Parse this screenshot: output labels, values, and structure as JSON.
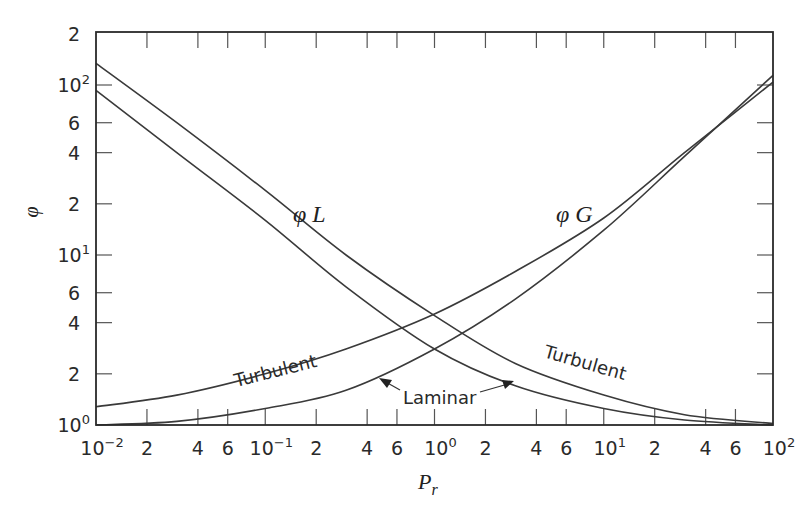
{
  "chart_data": {
    "type": "line",
    "title": "",
    "xlabel": "P_r",
    "ylabel": "φ",
    "xscale": "log",
    "yscale": "log",
    "xlim": [
      0.01,
      100
    ],
    "ylim": [
      1,
      200
    ],
    "grid": false,
    "x_ticks": [
      {
        "v": 0.01,
        "base": "10",
        "exp": "−2"
      },
      {
        "v": 0.02,
        "base": "2"
      },
      {
        "v": 0.04,
        "base": "4"
      },
      {
        "v": 0.06,
        "base": "6"
      },
      {
        "v": 0.1,
        "base": "10",
        "exp": "−1"
      },
      {
        "v": 0.2,
        "base": "2"
      },
      {
        "v": 0.4,
        "base": "4"
      },
      {
        "v": 0.6,
        "base": "6"
      },
      {
        "v": 1,
        "base": "10",
        "exp": "0"
      },
      {
        "v": 2,
        "base": "2"
      },
      {
        "v": 4,
        "base": "4"
      },
      {
        "v": 6,
        "base": "6"
      },
      {
        "v": 10,
        "base": "10",
        "exp": "1"
      },
      {
        "v": 20,
        "base": "2"
      },
      {
        "v": 40,
        "base": "4"
      },
      {
        "v": 60,
        "base": "6"
      },
      {
        "v": 100,
        "base": "10",
        "exp": "2"
      }
    ],
    "y_ticks": [
      {
        "v": 1,
        "base": "10",
        "exp": "0"
      },
      {
        "v": 2,
        "base": "2"
      },
      {
        "v": 4,
        "base": "4"
      },
      {
        "v": 6,
        "base": "6"
      },
      {
        "v": 10,
        "base": "10",
        "exp": "1"
      },
      {
        "v": 20,
        "base": "2"
      },
      {
        "v": 40,
        "base": "4"
      },
      {
        "v": 60,
        "base": "6"
      },
      {
        "v": 100,
        "base": "10",
        "exp": "2"
      },
      {
        "v": 200,
        "base": "2"
      }
    ],
    "x": [
      0.01,
      0.03,
      0.1,
      0.3,
      1,
      3,
      10,
      30,
      100
    ],
    "series": [
      {
        "name": "φL Turbulent",
        "values": [
          134,
          60,
          24,
          10,
          4.4,
          2.3,
          1.5,
          1.15,
          1.02
        ]
      },
      {
        "name": "φL Laminar",
        "values": [
          93,
          40,
          16,
          6.5,
          2.8,
          1.7,
          1.25,
          1.07,
          1.0
        ]
      },
      {
        "name": "φG Turbulent",
        "values": [
          1.28,
          1.5,
          2.0,
          2.8,
          4.5,
          8,
          16.5,
          40,
          104
        ]
      },
      {
        "name": "φG Laminar",
        "values": [
          1.0,
          1.05,
          1.25,
          1.6,
          2.8,
          5.5,
          14,
          38,
          114
        ]
      }
    ],
    "annotations": [
      {
        "text": "φ L",
        "near": "φL Turbulent",
        "x": 0.25,
        "y": 19
      },
      {
        "text": "φ G",
        "near": "φG Turbulent",
        "x": 7,
        "y": 19
      },
      {
        "text": "Turbulent",
        "near": "φG Turbulent",
        "x": 0.04,
        "y": 2.2
      },
      {
        "text": "Turbulent",
        "near": "φL Turbulent",
        "x": 7,
        "y": 2
      },
      {
        "text": "Laminar",
        "arrows_to": [
          "φG Laminar",
          "φL Laminar"
        ],
        "x": 1,
        "y": 1.35
      }
    ]
  },
  "labels": {
    "phiL": "φ L",
    "phiG": "φ G",
    "turbulent_left": "Turbulent",
    "turbulent_right": "Turbulent",
    "laminar": "Laminar",
    "xlabel_main": "P",
    "xlabel_sub": "r",
    "ylabel": "φ"
  }
}
